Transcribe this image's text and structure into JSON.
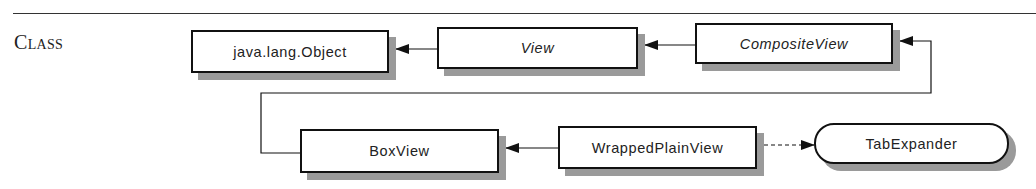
{
  "section": {
    "label": "Class"
  },
  "diagram": {
    "nodes": [
      {
        "id": "object",
        "label": "java.lang.Object",
        "kind": "class"
      },
      {
        "id": "view",
        "label": "View",
        "kind": "abstract"
      },
      {
        "id": "compositeview",
        "label": "CompositeView",
        "kind": "abstract"
      },
      {
        "id": "boxview",
        "label": "BoxView",
        "kind": "class"
      },
      {
        "id": "wrappedplainview",
        "label": "WrappedPlainView",
        "kind": "class"
      },
      {
        "id": "tabexpander",
        "label": "TabExpander",
        "kind": "interface"
      }
    ],
    "edges": [
      {
        "from": "view",
        "to": "object",
        "type": "extends"
      },
      {
        "from": "compositeview",
        "to": "view",
        "type": "extends"
      },
      {
        "from": "boxview",
        "to": "compositeview",
        "type": "extends"
      },
      {
        "from": "wrappedplainview",
        "to": "boxview",
        "type": "extends"
      },
      {
        "from": "wrappedplainview",
        "to": "tabexpander",
        "type": "implements"
      }
    ],
    "colors": {
      "line": "#111111",
      "shadow": "#9a9a9a",
      "text": "#222222"
    }
  }
}
